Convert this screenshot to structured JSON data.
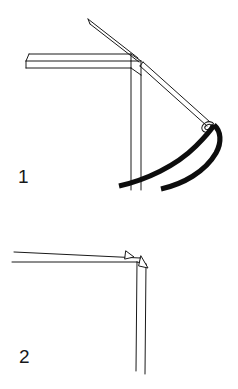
{
  "document": {
    "kind": "assembly-instruction-line-drawing",
    "background_color": "#ffffff",
    "ink_color": "#1a1a1a",
    "width": 238,
    "height": 389,
    "panel_count": 2
  },
  "figures": [
    {
      "id": "figure-1",
      "label": "1",
      "label_position": {
        "x": 18,
        "y": 167
      },
      "caption": "",
      "parts": [
        {
          "name": "horizontal-beam",
          "style": "outline",
          "stroke": "#1a1a1a"
        },
        {
          "name": "vertical-post",
          "style": "outline",
          "stroke": "#1a1a1a"
        },
        {
          "name": "corner-joint",
          "style": "outline",
          "stroke": "#1a1a1a"
        },
        {
          "name": "diagonal-pole",
          "style": "outline",
          "stroke": "#1a1a1a"
        },
        {
          "name": "tension-strut",
          "style": "outline",
          "stroke": "#1a1a1a"
        },
        {
          "name": "eyelet-ring",
          "style": "outline",
          "stroke": "#1a1a1a"
        },
        {
          "name": "shock-cord",
          "style": "solid-thick",
          "stroke": "#0d0d0d"
        }
      ]
    },
    {
      "id": "figure-2",
      "label": "2",
      "label_position": {
        "x": 19,
        "y": 347
      },
      "caption": "",
      "parts": [
        {
          "name": "horizontal-beam",
          "style": "outline",
          "stroke": "#1a1a1a"
        },
        {
          "name": "vertical-post",
          "style": "outline",
          "stroke": "#1a1a1a"
        },
        {
          "name": "corner-joint",
          "style": "outline",
          "stroke": "#1a1a1a"
        },
        {
          "name": "direction-arrow-horizontal",
          "style": "arrowhead",
          "stroke": "#1a1a1a"
        },
        {
          "name": "direction-arrow-vertical",
          "style": "arrowhead",
          "stroke": "#1a1a1a"
        }
      ]
    }
  ]
}
